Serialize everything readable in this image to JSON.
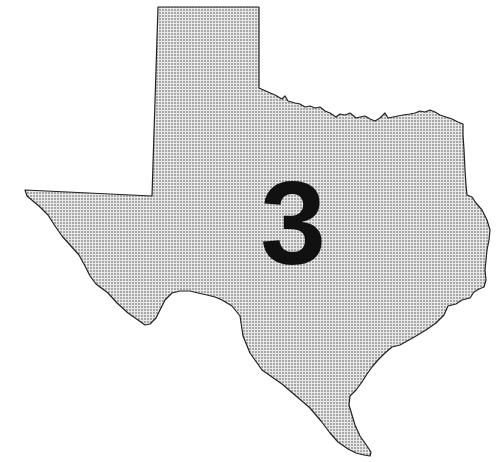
{
  "map": {
    "region": "Texas",
    "label": "3",
    "fill_pattern": "stipple",
    "fill_color": "#e6e6e6",
    "dot_color": "#555555",
    "outline_color": "#222222",
    "label_color": "#111111"
  }
}
